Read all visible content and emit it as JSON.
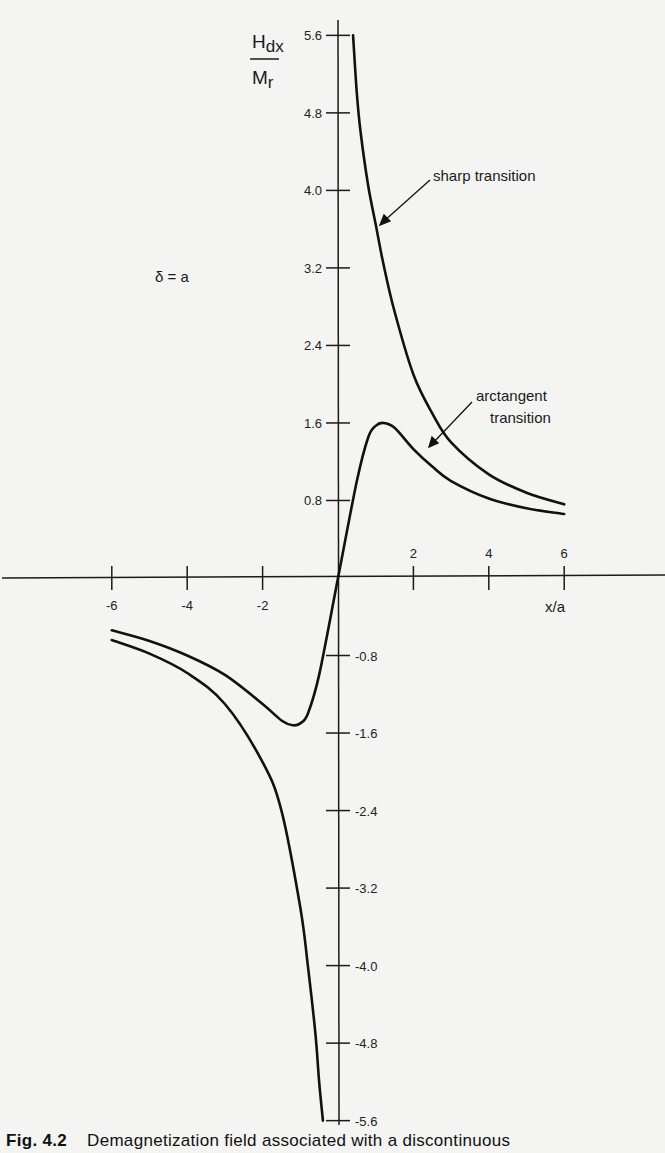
{
  "chart_data": {
    "type": "line",
    "title": "",
    "xlabel": "x/a",
    "ylabel": "H_dx / M_r",
    "ylabel_parts": {
      "numerator": "H",
      "numerator_sub": "dx",
      "denominator": "M",
      "denominator_sub": "r"
    },
    "xlim": [
      -6.5,
      7.5
    ],
    "ylim": [
      -5.8,
      5.8
    ],
    "x_ticks": [
      -6,
      -4,
      -2,
      2,
      4,
      6
    ],
    "x_tick_labels": [
      "-6",
      "-4",
      "-2",
      "2",
      "4",
      "6"
    ],
    "y_ticks": [
      5.6,
      4.8,
      4.0,
      3.2,
      2.4,
      1.6,
      0.8,
      -0.8,
      -1.6,
      -2.4,
      -3.2,
      -4.0,
      -4.8,
      -5.6
    ],
    "y_tick_labels": [
      "5.6",
      "4.8",
      "4.0",
      "3.2",
      "2.4",
      "1.6",
      "0.8",
      "-0.8",
      "-1.6",
      "-2.4",
      "-3.2",
      "-4.0",
      "-4.8",
      "-5.6"
    ],
    "grid": false,
    "legend": "none (curves labeled with arrows)",
    "annotations": [
      {
        "text": "sharp transition",
        "points_to": "sharp transition curve near x/a≈1.1, y≈3.6"
      },
      {
        "text": "arctangent transition",
        "points_to": "arctangent transition curve near x/a≈2.2, y≈1.2"
      },
      {
        "text": "δ = a",
        "position": "upper left"
      }
    ],
    "series": [
      {
        "name": "sharp transition",
        "x": [
          0.4,
          0.5,
          0.6,
          0.8,
          1.0,
          1.2,
          1.5,
          2.0,
          2.5,
          3.0,
          4.0,
          5.0,
          6.0
        ],
        "y": [
          5.6,
          5.0,
          4.6,
          4.05,
          3.65,
          3.25,
          2.75,
          2.1,
          1.7,
          1.4,
          1.07,
          0.88,
          0.76
        ]
      },
      {
        "name": "arctangent transition",
        "x": [
          -6.0,
          -5.0,
          -4.0,
          -3.0,
          -2.0,
          -1.5,
          -1.2,
          -1.0,
          -0.8,
          -0.5,
          0.0,
          0.5,
          0.8,
          1.0,
          1.2,
          1.5,
          2.0,
          2.5,
          3.0,
          4.0,
          5.0,
          6.0
        ],
        "y": [
          -0.54,
          -0.65,
          -0.8,
          -1.0,
          -1.3,
          -1.47,
          -1.52,
          -1.5,
          -1.4,
          -1.0,
          0.0,
          1.0,
          1.45,
          1.57,
          1.6,
          1.55,
          1.33,
          1.15,
          1.0,
          0.82,
          0.72,
          0.66
        ]
      },
      {
        "name": "sharp transition (negative branch)",
        "x": [
          -6.0,
          -5.0,
          -4.0,
          -3.0,
          -2.0,
          -1.5,
          -1.0,
          -0.8,
          -0.6,
          -0.5,
          -0.4
        ],
        "y": [
          -0.64,
          -0.78,
          -0.98,
          -1.3,
          -1.9,
          -2.4,
          -3.4,
          -4.0,
          -4.7,
          -5.2,
          -5.6
        ]
      }
    ]
  },
  "labels": {
    "delta_eq": "δ = a",
    "sharp": "sharp transition",
    "arctan_line1": "arctangent",
    "arctan_line2": "transition",
    "xaxis": "x/a",
    "y_num": "H",
    "y_num_sub": "dx",
    "y_den": "M",
    "y_den_sub": "r"
  },
  "caption": {
    "fig": "Fig. 4.2",
    "text": "Demagnetization field associated with a discontinuous"
  }
}
